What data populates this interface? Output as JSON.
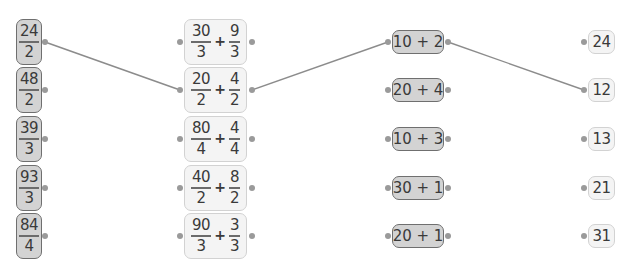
{
  "colors": {
    "dark_card_bg": "#d3d3d3",
    "dark_card_border": "#6f6f6f",
    "light_card_bg": "#f4f4f4",
    "light_card_border": "#d2d2d2",
    "connector": "#8c8c8c",
    "dot": "#9a9a9a"
  },
  "column_fractions": [
    {
      "num": "24",
      "den": "2"
    },
    {
      "num": "48",
      "den": "2"
    },
    {
      "num": "39",
      "den": "3"
    },
    {
      "num": "93",
      "den": "3"
    },
    {
      "num": "84",
      "den": "4"
    }
  ],
  "column_split_sums": [
    {
      "a_num": "30",
      "a_den": "3",
      "op": "+",
      "b_num": "9",
      "b_den": "3"
    },
    {
      "a_num": "20",
      "a_den": "2",
      "op": "+",
      "b_num": "4",
      "b_den": "2"
    },
    {
      "a_num": "80",
      "a_den": "4",
      "op": "+",
      "b_num": "4",
      "b_den": "4"
    },
    {
      "a_num": "40",
      "a_den": "2",
      "op": "+",
      "b_num": "8",
      "b_den": "2"
    },
    {
      "a_num": "90",
      "a_den": "3",
      "op": "+",
      "b_num": "3",
      "b_den": "3"
    }
  ],
  "column_sums": [
    {
      "label": "10 + 2"
    },
    {
      "label": "20 + 4"
    },
    {
      "label": "10 + 3"
    },
    {
      "label": "30 + 1"
    },
    {
      "label": "20 + 1"
    }
  ],
  "column_results": [
    {
      "label": "24"
    },
    {
      "label": "12"
    },
    {
      "label": "13"
    },
    {
      "label": "21"
    },
    {
      "label": "31"
    }
  ],
  "connections": [
    {
      "from": "fraction-1",
      "to": "split-sum-2"
    },
    {
      "from": "split-sum-2",
      "to": "sum-1"
    },
    {
      "from": "sum-1",
      "to": "result-2"
    }
  ]
}
